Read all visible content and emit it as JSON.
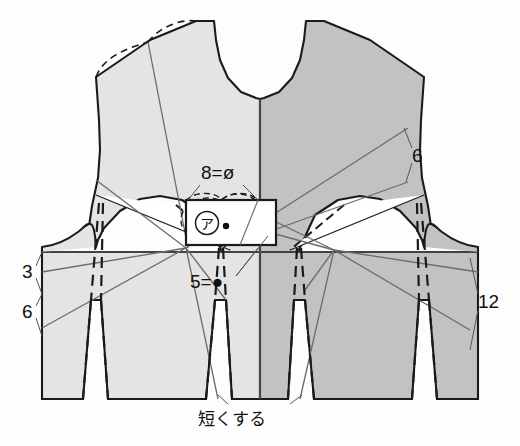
{
  "diagram": {
    "colors": {
      "left_panel_fill": "#e4e4e4",
      "right_panel_fill": "#c2c2c2",
      "outline": "#1a1a1a",
      "construction_line": "#6b6b6b",
      "dash_line": "#1a1a1a",
      "background": "#fdfdfd",
      "box_fill": "#ffffff"
    },
    "labels": {
      "top_center": "8=ø",
      "mid_center": "5=●",
      "left_upper": "3",
      "left_lower": "6",
      "right_upper": "6",
      "right_lower": "12",
      "bottom_center": "短くする",
      "box_marker": "ア"
    },
    "measurements": [
      {
        "name": "left-upper",
        "value": "3",
        "x": 26,
        "y": 272
      },
      {
        "name": "left-lower",
        "value": "6",
        "x": 26,
        "y": 312
      },
      {
        "name": "right-upper",
        "value": "6",
        "x": 417,
        "y": 155
      },
      {
        "name": "right-lower",
        "value": "12",
        "x": 481,
        "y": 302
      },
      {
        "name": "top-center",
        "value": "8=ø",
        "x": 201,
        "y": 179
      },
      {
        "name": "mid-center",
        "value": "5=●",
        "x": 194,
        "y": 286
      }
    ],
    "annotations": [
      {
        "name": "shorten-note",
        "value": "短くする"
      }
    ]
  }
}
